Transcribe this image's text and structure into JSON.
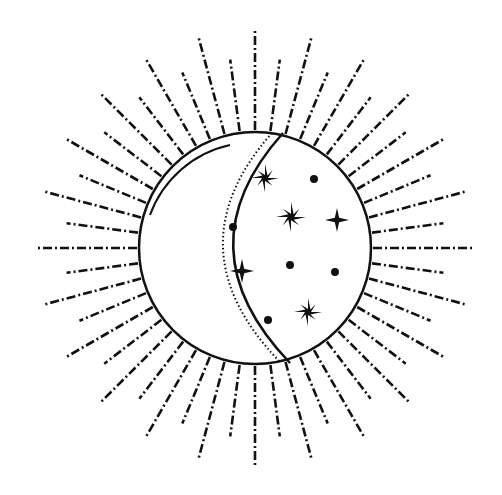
{
  "illustration": {
    "title": "Crescent moon with stars inside sunburst",
    "ink_color": "#111111",
    "background": "#ffffff",
    "center": [
      255,
      248
    ],
    "circle_radius": 116,
    "ray_count": 48,
    "ray_long_length": 100,
    "ray_short_length": 72,
    "stars": [
      {
        "type": "sparkle",
        "x": 265,
        "y": 178,
        "size": 14
      },
      {
        "type": "sparkle",
        "x": 291,
        "y": 217,
        "size": 15
      },
      {
        "type": "cross",
        "x": 337,
        "y": 220,
        "size": 12
      },
      {
        "type": "cross",
        "x": 242,
        "y": 271,
        "size": 12
      },
      {
        "type": "sparkle",
        "x": 308,
        "y": 312,
        "size": 14
      }
    ],
    "dots": [
      {
        "x": 314,
        "y": 179
      },
      {
        "x": 233,
        "y": 227
      },
      {
        "x": 290,
        "y": 265
      },
      {
        "x": 335,
        "y": 272
      },
      {
        "x": 268,
        "y": 320
      }
    ]
  }
}
